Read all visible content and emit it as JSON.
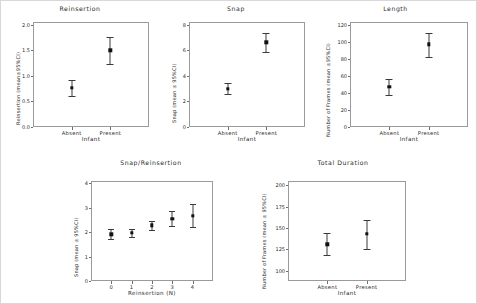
{
  "figure": {
    "background": "#ffffff",
    "marker_color": "#111111",
    "axis_color": "#9a9a9a"
  },
  "chart_data": [
    {
      "id": "reinsertion",
      "type": "scatter",
      "title": "Reinsertion",
      "xlabel": "Infant",
      "ylabel": "Reinsertion (mean±95%CI)",
      "categories": [
        "Absent",
        "Present"
      ],
      "values": [
        0.76,
        1.5
      ],
      "ci_low": [
        0.61,
        1.23
      ],
      "ci_high": [
        0.92,
        1.75
      ],
      "yticks": [
        "0.0",
        "0.5",
        "1.0",
        "1.5",
        "2.0"
      ],
      "ytick_values": [
        0.0,
        0.5,
        1.0,
        1.5,
        2.0
      ],
      "ylim": [
        0.0,
        2.05
      ],
      "grid": false,
      "legend": "none"
    },
    {
      "id": "snap",
      "type": "scatter",
      "title": "Snap",
      "xlabel": "Infant",
      "ylabel": "Snap (mean ± 95%CI)",
      "categories": [
        "Absent",
        "Present"
      ],
      "values": [
        3.0,
        6.6
      ],
      "ci_low": [
        2.6,
        5.85
      ],
      "ci_high": [
        3.4,
        7.35
      ],
      "yticks": [
        "0",
        "2",
        "4",
        "6",
        "8"
      ],
      "ytick_values": [
        0,
        2,
        4,
        6,
        8
      ],
      "ylim": [
        0,
        8.2
      ],
      "grid": false,
      "legend": "none"
    },
    {
      "id": "length",
      "type": "scatter",
      "title": "Length",
      "xlabel": "Infant",
      "ylabel": "Number of Frames (mean ±95%CI)",
      "categories": [
        "Absent",
        "Present"
      ],
      "values": [
        47,
        97
      ],
      "ci_low": [
        38,
        82
      ],
      "ci_high": [
        56,
        110
      ],
      "yticks": [
        "0",
        "20",
        "40",
        "60",
        "80",
        "100",
        "120"
      ],
      "ytick_values": [
        0,
        20,
        40,
        60,
        80,
        100,
        120
      ],
      "ylim": [
        0,
        123
      ],
      "grid": false,
      "legend": "none"
    },
    {
      "id": "snap-reinsertion",
      "type": "scatter",
      "title": "Snap/Reinsertion",
      "xlabel": "Reinsertion (N)",
      "ylabel": "Snap (mean ± 95%CI)",
      "categories": [
        "0",
        "1",
        "2",
        "3",
        "4"
      ],
      "values": [
        1.92,
        1.97,
        2.28,
        2.55,
        2.68
      ],
      "ci_low": [
        1.72,
        1.82,
        2.1,
        2.25,
        2.22
      ],
      "ci_high": [
        2.14,
        2.13,
        2.46,
        2.88,
        3.15
      ],
      "yticks": [
        "0",
        "1",
        "2",
        "3",
        "4"
      ],
      "ytick_values": [
        0,
        1,
        2,
        3,
        4
      ],
      "ylim": [
        0,
        4.1
      ],
      "grid": false,
      "legend": "none"
    },
    {
      "id": "total-duration",
      "type": "scatter",
      "title": "Total Duration",
      "xlabel": "Infant",
      "ylabel": "Number of Frames (mean ± 95%CI)",
      "categories": [
        "Absent",
        "Present"
      ],
      "values": [
        131,
        143
      ],
      "ci_low": [
        118,
        126
      ],
      "ci_high": [
        144,
        159
      ],
      "yticks": [
        "100",
        "125",
        "150",
        "175",
        "200"
      ],
      "ytick_values": [
        100,
        125,
        150,
        175,
        200
      ],
      "ylim": [
        88,
        205
      ],
      "grid": false,
      "legend": "none"
    }
  ]
}
